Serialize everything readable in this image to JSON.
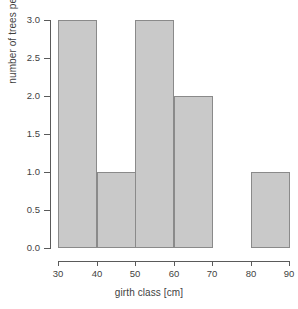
{
  "chart_data": {
    "type": "bar",
    "title": "",
    "xlabel": "girth class [cm]",
    "ylabel": "number of trees per class",
    "categories": [
      "30-40",
      "40-50",
      "50-60",
      "60-70",
      "70-80",
      "80-90"
    ],
    "bin_edges": [
      30,
      40,
      50,
      60,
      70,
      80,
      90
    ],
    "values": [
      3,
      1,
      3,
      2,
      0,
      1
    ],
    "xlim": [
      30,
      90
    ],
    "ylim": [
      0,
      3
    ],
    "xticks": [
      "30",
      "40",
      "50",
      "60",
      "70",
      "80",
      "90"
    ],
    "xtick_values": [
      30,
      40,
      50,
      60,
      70,
      80,
      90
    ],
    "yticks": [
      "0.0",
      "0.5",
      "1.0",
      "1.5",
      "2.0",
      "2.5",
      "3.0"
    ],
    "ytick_values": [
      0,
      0.5,
      1,
      1.5,
      2,
      2.5,
      3
    ],
    "grid": false,
    "legend": null,
    "bar_fill_color": "#c9c9c9",
    "bar_border_color": "#8a8a8a",
    "axis_color": "#5a5a5a",
    "text_color": "#3f3f3f",
    "background_color": "#ffffff"
  }
}
